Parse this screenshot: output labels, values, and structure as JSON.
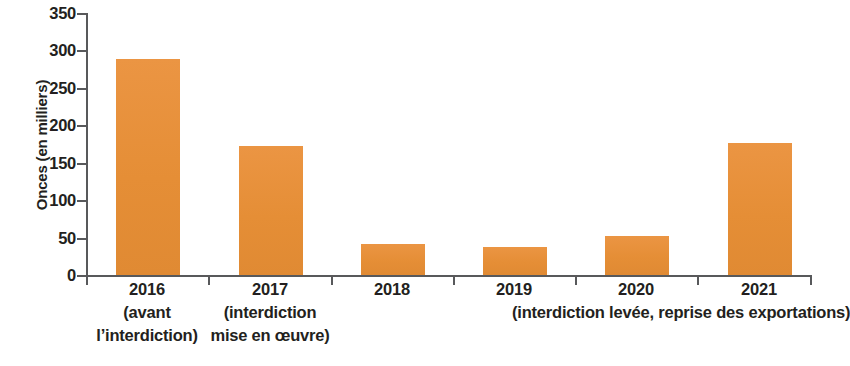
{
  "chart_data": {
    "type": "bar",
    "title": "",
    "subtitle": "",
    "xlabel": "",
    "ylabel": "Onces (en milliers)",
    "ylim": [
      0,
      350
    ],
    "ytick_step": 50,
    "yticks": [
      "350",
      "300",
      "250",
      "200",
      "150",
      "100",
      "50",
      "0"
    ],
    "ytick_values": [
      350,
      300,
      250,
      200,
      150,
      100,
      50,
      0
    ],
    "grid": false,
    "legend": null,
    "bar_color": "#e8913c",
    "axis_color": "#58595b",
    "text_color": "#231f20",
    "categories": [
      "2016",
      "2017",
      "2018",
      "2019",
      "2020",
      "2021"
    ],
    "values": [
      288,
      172,
      41,
      38,
      52,
      176
    ],
    "category_notes": [
      [
        "(avant",
        "l’interdiction)"
      ],
      [
        "(interdiction",
        "mise en œuvre)"
      ],
      [],
      [],
      [],
      []
    ],
    "annotations": [
      {
        "text_lines": [
          "(interdiction levée,",
          "reprise des exportations)"
        ],
        "spans_categories": [
          "2020",
          "2021"
        ]
      }
    ]
  }
}
